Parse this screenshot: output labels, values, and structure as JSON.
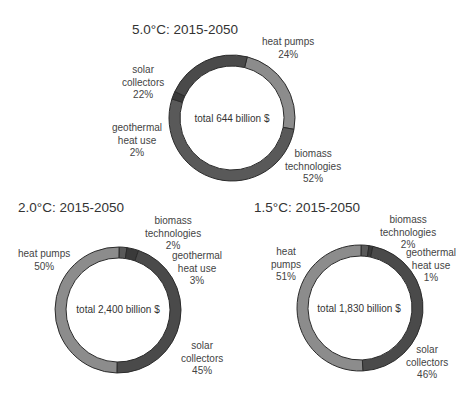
{
  "chart_data": [
    {
      "type": "pie",
      "title": "5.0°C: 2015-2050",
      "center_label": "total 644 billion $",
      "categories": [
        "heat pumps",
        "biomass technologies",
        "geothermal heat use",
        "solar collectors"
      ],
      "values": [
        24,
        52,
        2,
        22
      ],
      "labels": [
        {
          "line1": "heat pumps",
          "line2": "",
          "pct": "24%"
        },
        {
          "line1": "biomass",
          "line2": "technologies",
          "pct": "52%"
        },
        {
          "line1": "geothermal",
          "line2": "heat use",
          "pct": "2%"
        },
        {
          "line1": "solar",
          "line2": "collectors",
          "pct": "22%"
        }
      ]
    },
    {
      "type": "pie",
      "title": "2.0°C: 2015-2050",
      "center_label": "total 2,400 billion $",
      "categories": [
        "biomass technologies",
        "geothermal heat use",
        "solar collectors",
        "heat pumps"
      ],
      "values": [
        2,
        3,
        45,
        50
      ],
      "labels": [
        {
          "line1": "biomass",
          "line2": "technologies",
          "pct": "2%"
        },
        {
          "line1": "geothermal",
          "line2": "heat use",
          "pct": "3%"
        },
        {
          "line1": "solar",
          "line2": "collectors",
          "pct": "45%"
        },
        {
          "line1": "heat pumps",
          "line2": "",
          "pct": "50%"
        }
      ]
    },
    {
      "type": "pie",
      "title": "1.5°C: 2015-2050",
      "center_label": "total 1,830 billion $",
      "categories": [
        "biomass technologies",
        "geothermal heat use",
        "solar collectors",
        "heat pumps"
      ],
      "values": [
        2,
        1,
        46,
        51
      ],
      "labels": [
        {
          "line1": "biomass",
          "line2": "technologies",
          "pct": "2%"
        },
        {
          "line1": "geothermal",
          "line2": "heat use",
          "pct": "1%"
        },
        {
          "line1": "solar",
          "line2": "collectors",
          "pct": "46%"
        },
        {
          "line1": "heat",
          "line2": "pumps",
          "pct": "51%"
        }
      ]
    }
  ],
  "colors": {
    "heat_pumps": "#8c8c8c",
    "biomass": "#595959",
    "geothermal": "#3a3a3a",
    "solar": "#4a4a4a",
    "edge": "#2b2b2b"
  }
}
